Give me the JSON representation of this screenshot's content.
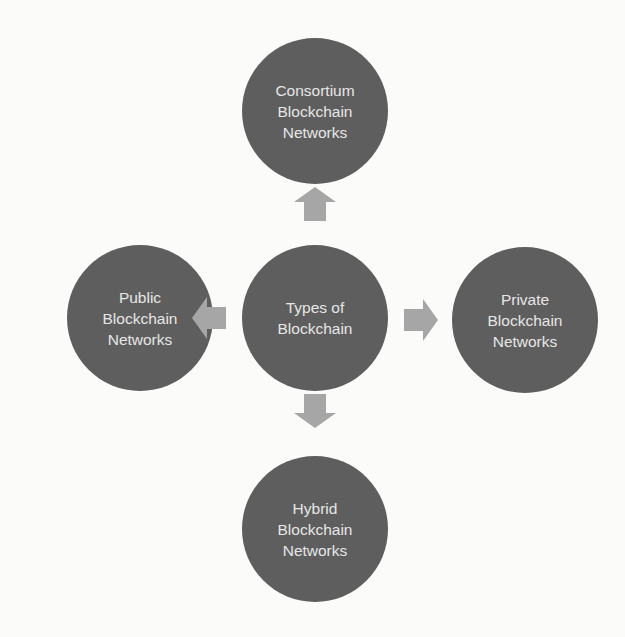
{
  "diagram": {
    "title": "Types of Blockchain",
    "colors": {
      "node": "#5e5e5e",
      "node_text": "#e6e6e6",
      "arrow": "#a6a6a6",
      "background": "#fbfbfa"
    },
    "center": {
      "label": "Types of\nBlockchain"
    },
    "nodes": [
      {
        "id": "consortium",
        "position": "top",
        "label": "Consortium\nBlockchain\nNetworks"
      },
      {
        "id": "public",
        "position": "left",
        "label": "Public\nBlockchain\nNetworks"
      },
      {
        "id": "private",
        "position": "right",
        "label": "Private\nBlockchain\nNetworks"
      },
      {
        "id": "hybrid",
        "position": "bottom",
        "label": "Hybrid\nBlockchain\nNetworks"
      }
    ],
    "arrows": [
      {
        "from": "center",
        "to": "consortium",
        "direction": "up"
      },
      {
        "from": "center",
        "to": "public",
        "direction": "left"
      },
      {
        "from": "center",
        "to": "private",
        "direction": "right"
      },
      {
        "from": "center",
        "to": "hybrid",
        "direction": "down"
      }
    ]
  }
}
